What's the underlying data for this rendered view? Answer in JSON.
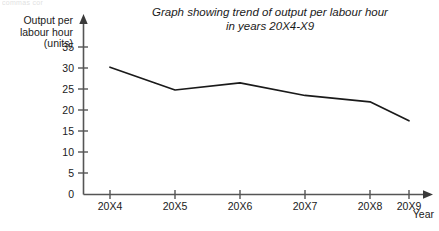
{
  "scan_artifact": "commas cor",
  "chart_data": {
    "type": "line",
    "title": "Graph showing trend of output per labour hour in years 20X4-X9",
    "title_lines": [
      "Graph showing trend of output per labour hour",
      "in years 20X4-X9"
    ],
    "ylabel": "Output per labour hour (units)",
    "ylabel_lines": [
      "Output per",
      "labour hour",
      "(units)"
    ],
    "xlabel": "Year",
    "categories": [
      "20X4",
      "20X5",
      "20X6",
      "20X7",
      "20X8",
      "20X9"
    ],
    "values": [
      30.2,
      24.8,
      26.5,
      23.5,
      22.0,
      17.5
    ],
    "series": [
      {
        "name": "Output per labour hour",
        "values": [
          30.2,
          24.8,
          26.5,
          23.5,
          22.0,
          17.5
        ]
      }
    ],
    "ylim": [
      0,
      35
    ],
    "yticks": [
      0,
      5,
      10,
      15,
      20,
      25,
      30,
      35
    ],
    "ytick_labels": [
      "0",
      "5",
      "10",
      "15",
      "20",
      "25",
      "30",
      "35"
    ],
    "grid": false,
    "legend": false,
    "line_color": "#1a1a1a",
    "axis_color": "#555555",
    "markers": false
  }
}
